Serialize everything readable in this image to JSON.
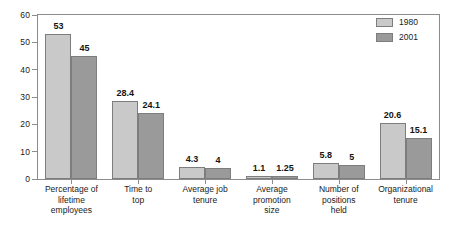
{
  "chart_data": {
    "type": "bar",
    "title": "",
    "subtitle": "",
    "xlabel": "",
    "ylabel": "",
    "ylim": [
      0,
      60
    ],
    "yticks": [
      0,
      10,
      20,
      30,
      40,
      50,
      60
    ],
    "ytick_labels": [
      "0",
      "10",
      "20",
      "30",
      "40",
      "50",
      "60"
    ],
    "grid": false,
    "legend_position": "top-right",
    "categories": [
      "Percentage of lifetime employees",
      "Time to top",
      "Average job tenure",
      "Average promotion size",
      "Number of positions held",
      "Organizational tenure"
    ],
    "category_lines": [
      [
        "Percentage of",
        "lifetime",
        "employees"
      ],
      [
        "Time to",
        "top"
      ],
      [
        "Average job",
        "tenure"
      ],
      [
        "Average",
        "promotion",
        "size"
      ],
      [
        "Number of",
        "positions",
        "held"
      ],
      [
        "Organizational",
        "tenure"
      ]
    ],
    "series": [
      {
        "name": "1980",
        "color": "#c9c9c9",
        "values": [
          53,
          28.4,
          4.3,
          1.1,
          5.8,
          20.6
        ],
        "value_labels": [
          "53",
          "28.4",
          "4.3",
          "1.1",
          "5.8",
          "20.6"
        ]
      },
      {
        "name": "2001",
        "color": "#9a9a9a",
        "values": [
          45,
          24.1,
          4,
          1.25,
          5,
          15.1
        ],
        "value_labels": [
          "45",
          "24.1",
          "4",
          "1.25",
          "5",
          "15.1"
        ]
      }
    ]
  },
  "legend": {
    "items": [
      {
        "label": "1980",
        "swatch": "#c9c9c9"
      },
      {
        "label": "2001",
        "swatch": "#9a9a9a"
      }
    ]
  },
  "colors": {
    "series_1980": "#c9c9c9",
    "series_2001": "#9a9a9a",
    "axis": "#8c8c8c",
    "text": "#1a1a1a",
    "background": "#ffffff"
  }
}
